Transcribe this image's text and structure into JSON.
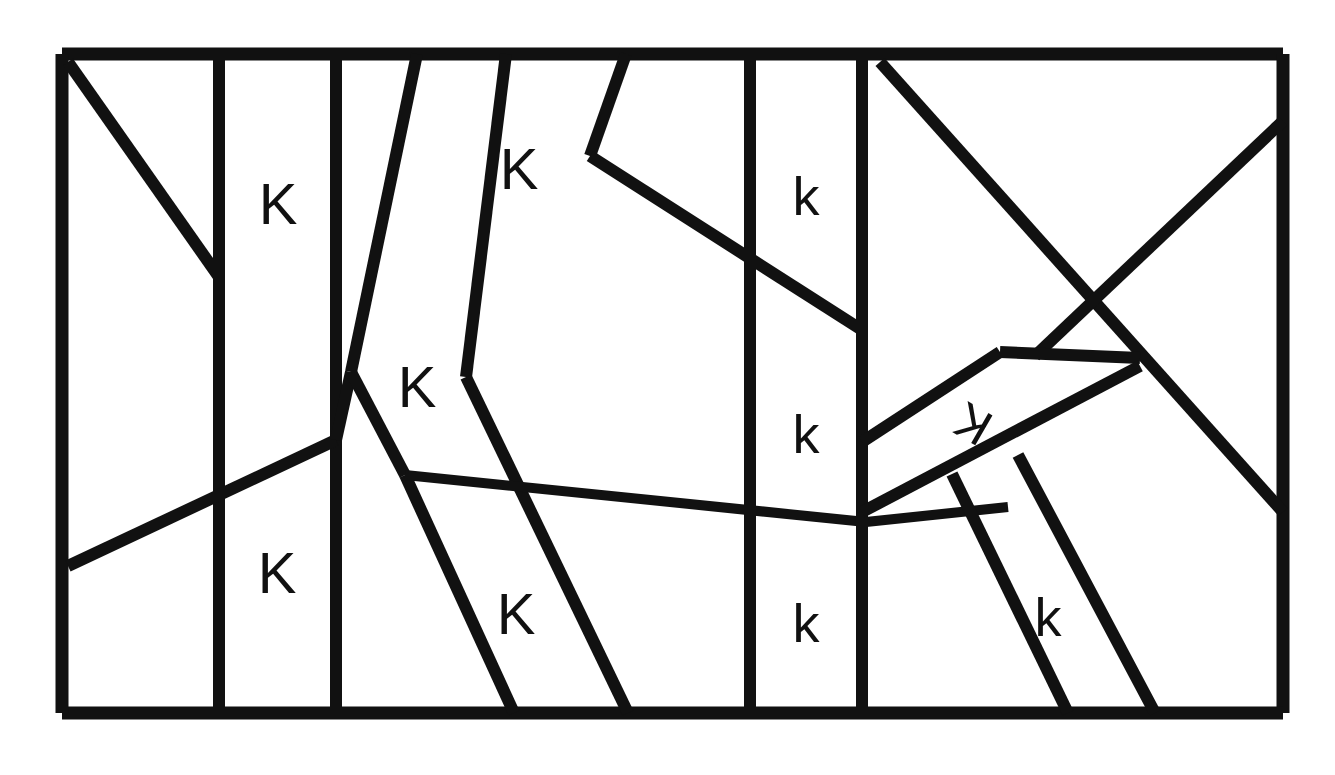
{
  "figure": {
    "background_color": "#ffffff",
    "stroke_color": "#111111",
    "canvas": {
      "width": 1335,
      "height": 775
    },
    "border": {
      "label": "outer-rectangle",
      "x1": 62,
      "y1": 54,
      "x2": 1283,
      "y2": 713
    }
  },
  "labels": [
    {
      "id": "label-1",
      "text": "K",
      "x": 278,
      "y": 203,
      "size": 58,
      "rotation": 0
    },
    {
      "id": "label-2",
      "text": "K",
      "x": 519,
      "y": 168,
      "size": 58,
      "rotation": 0
    },
    {
      "id": "label-3",
      "text": "k",
      "x": 806,
      "y": 196,
      "size": 54,
      "rotation": 0
    },
    {
      "id": "label-4",
      "text": "K",
      "x": 417,
      "y": 386,
      "size": 58,
      "rotation": 0
    },
    {
      "id": "label-5",
      "text": "k",
      "x": 806,
      "y": 434,
      "size": 54,
      "rotation": 0
    },
    {
      "id": "label-6",
      "text": "K",
      "x": 973,
      "y": 424,
      "size": 50,
      "rotation": -150
    },
    {
      "id": "label-7",
      "text": "K",
      "x": 277,
      "y": 572,
      "size": 58,
      "rotation": 0
    },
    {
      "id": "label-8",
      "text": "K",
      "x": 516,
      "y": 613,
      "size": 58,
      "rotation": 0
    },
    {
      "id": "label-9",
      "text": "k",
      "x": 806,
      "y": 623,
      "size": 54,
      "rotation": 0
    },
    {
      "id": "label-10",
      "text": "k",
      "x": 1048,
      "y": 617,
      "size": 54,
      "rotation": 0
    }
  ],
  "segments": [
    {
      "id": "border-top",
      "kind": "border",
      "x1": 62,
      "y1": 54,
      "x2": 1283,
      "y2": 54
    },
    {
      "id": "border-right",
      "kind": "border",
      "x1": 1283,
      "y1": 54,
      "x2": 1283,
      "y2": 713
    },
    {
      "id": "border-bottom",
      "kind": "border",
      "x1": 1283,
      "y1": 713,
      "x2": 62,
      "y2": 713
    },
    {
      "id": "border-left",
      "kind": "border",
      "x1": 62,
      "y1": 713,
      "x2": 62,
      "y2": 54
    },
    {
      "id": "seg-diag-top-left",
      "kind": "inner",
      "x1": 68,
      "y1": 62,
      "x2": 219,
      "y2": 277
    },
    {
      "id": "seg-vert-1",
      "kind": "inner",
      "x1": 219,
      "y1": 54,
      "x2": 219,
      "y2": 713
    },
    {
      "id": "seg-vert-2",
      "kind": "inner",
      "x1": 336,
      "y1": 54,
      "x2": 336,
      "y2": 713
    },
    {
      "id": "seg-lower-left-diag",
      "kind": "inner",
      "x1": 68,
      "y1": 566,
      "x2": 336,
      "y2": 440
    },
    {
      "id": "seg-lower-left-ext",
      "kind": "inner",
      "x1": 336,
      "y1": 440,
      "x2": 351,
      "y2": 372
    },
    {
      "id": "seg-mid-long-a",
      "kind": "inner",
      "x1": 417,
      "y1": 54,
      "x2": 351,
      "y2": 372
    },
    {
      "id": "seg-mid-long-b",
      "kind": "inner",
      "x1": 351,
      "y1": 372,
      "x2": 405,
      "y2": 475
    },
    {
      "id": "seg-mid-long-c",
      "kind": "inner",
      "x1": 405,
      "y1": 475,
      "x2": 514,
      "y2": 713
    },
    {
      "id": "seg-steep-a",
      "kind": "inner",
      "x1": 506,
      "y1": 54,
      "x2": 466,
      "y2": 377
    },
    {
      "id": "seg-steep-b",
      "kind": "inner",
      "x1": 466,
      "y1": 377,
      "x2": 628,
      "y2": 713
    },
    {
      "id": "seg-upper-right-1",
      "kind": "inner",
      "x1": 626,
      "y1": 54,
      "x2": 590,
      "y2": 156
    },
    {
      "id": "seg-upper-right-2",
      "kind": "inner",
      "x1": 590,
      "y1": 156,
      "x2": 862,
      "y2": 330
    },
    {
      "id": "seg-horiz-mid",
      "kind": "thin",
      "x1": 405,
      "y1": 475,
      "x2": 866,
      "y2": 522
    },
    {
      "id": "seg-horiz-mid-2",
      "kind": "thin",
      "x1": 866,
      "y1": 522,
      "x2": 1008,
      "y2": 507
    },
    {
      "id": "seg-vert-3",
      "kind": "inner",
      "x1": 750,
      "y1": 54,
      "x2": 750,
      "y2": 713
    },
    {
      "id": "seg-vert-4",
      "kind": "inner",
      "x1": 862,
      "y1": 54,
      "x2": 862,
      "y2": 713
    },
    {
      "id": "seg-right-big-diag",
      "kind": "inner",
      "x1": 880,
      "y1": 62,
      "x2": 1283,
      "y2": 512
    },
    {
      "id": "seg-right-corner",
      "kind": "inner",
      "x1": 1283,
      "y1": 121,
      "x2": 1035,
      "y2": 356
    },
    {
      "id": "seg-roof-left",
      "kind": "inner",
      "x1": 862,
      "y1": 442,
      "x2": 1000,
      "y2": 352
    },
    {
      "id": "seg-roof-top",
      "kind": "inner",
      "x1": 1000,
      "y1": 352,
      "x2": 1140,
      "y2": 358
    },
    {
      "id": "seg-roof-under",
      "kind": "inner",
      "x1": 862,
      "y1": 512,
      "x2": 1140,
      "y2": 366
    },
    {
      "id": "seg-right-v1",
      "kind": "inner",
      "x1": 952,
      "y1": 474,
      "x2": 1068,
      "y2": 713
    },
    {
      "id": "seg-right-v2",
      "kind": "inner",
      "x1": 1018,
      "y1": 455,
      "x2": 1155,
      "y2": 713
    }
  ]
}
